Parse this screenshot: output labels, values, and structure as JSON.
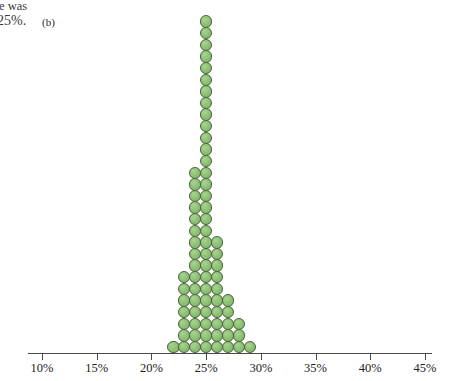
{
  "bleed_text": {
    "line1": "e was",
    "line2": "25%."
  },
  "panel": {
    "label": "(b)"
  },
  "chart_data": {
    "type": "bar",
    "subtype": "dot-plot",
    "title": "",
    "subtitle": "",
    "xlabel": "",
    "ylabel": "",
    "grid": false,
    "legend": null,
    "xlim": [
      10,
      45
    ],
    "xtick_step": 5,
    "tick_labels": [
      "10%",
      "15%",
      "20%",
      "25%",
      "30%",
      "35%",
      "40%",
      "45%"
    ],
    "tick_values": [
      10,
      15,
      20,
      25,
      30,
      35,
      40,
      45
    ],
    "categories": [
      "22%",
      "23%",
      "24%",
      "25%",
      "26%",
      "27%",
      "28%",
      "29%"
    ],
    "x": [
      22,
      23,
      24,
      25,
      26,
      27,
      28,
      29
    ],
    "values": [
      1,
      7,
      16,
      29,
      10,
      5,
      3,
      1
    ],
    "total_count": 72,
    "dot_value": 1,
    "mode": 25,
    "annotations": [
      "(b)"
    ],
    "colors": {
      "dot_fill": "#8cbf74",
      "dot_stroke": "#49663b",
      "axis": "#4a4a4a",
      "text": "#222222",
      "background": "#ffffff"
    }
  }
}
